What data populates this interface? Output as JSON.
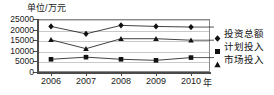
{
  "chart_data": {
    "type": "line",
    "title": "",
    "unit_label": "单位/万元",
    "xlabel": "年",
    "ylabel": "",
    "categories": [
      "2006",
      "2007",
      "2008",
      "2009",
      "2010"
    ],
    "x": [
      2006,
      2007,
      2008,
      2009,
      2010
    ],
    "ylim": [
      0,
      25000
    ],
    "yticks": [
      "0",
      "5000",
      "10000",
      "15000",
      "20000",
      "25000"
    ],
    "ytick_values": [
      0,
      5000,
      10000,
      15000,
      20000,
      25000
    ],
    "grid": true,
    "legend_position": "right",
    "series": [
      {
        "name": "投资总额",
        "marker": "diamond",
        "color": "#111111",
        "values": [
          21500,
          18000,
          22000,
          21500,
          21200
        ]
      },
      {
        "name": "计划投入",
        "marker": "triangle",
        "color": "#111111",
        "values": [
          15200,
          11000,
          15700,
          15700,
          15000
        ]
      },
      {
        "name": "市场投入",
        "marker": "square",
        "color": "#111111",
        "values": [
          6000,
          7000,
          6000,
          5500,
          6800
        ]
      }
    ],
    "legend_entries": [
      {
        "label": "投资总额",
        "marker": "diamond"
      },
      {
        "label": "计划投入",
        "marker": "square"
      },
      {
        "label": "市场投入",
        "marker": "triangle"
      }
    ]
  }
}
